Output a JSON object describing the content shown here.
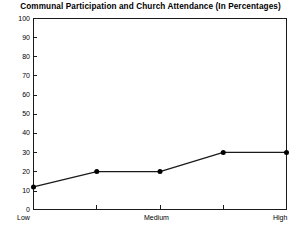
{
  "chart_data": {
    "type": "line",
    "title": "Communal Participation and Church Attendance (In Percentages)",
    "xlabel": "",
    "ylabel": "",
    "categories": [
      "Low",
      "",
      "Medium",
      "",
      "High"
    ],
    "values": [
      12,
      20,
      20,
      30,
      30
    ],
    "series": [
      {
        "name": "Church Attendance",
        "values": [
          12,
          20,
          20,
          30,
          30
        ]
      }
    ],
    "ylim": [
      0,
      100
    ],
    "ytick_labels": [
      "100",
      "90",
      "80",
      "70",
      "60",
      "50",
      "40",
      "30",
      "20",
      "10",
      "0"
    ],
    "ytick_values": [
      100,
      90,
      80,
      70,
      60,
      50,
      40,
      30,
      20,
      10,
      0
    ],
    "xtick_labels": [
      "Low",
      "Medium",
      "High"
    ],
    "grid": false,
    "legend": "none",
    "marker": "filled-circle",
    "line_color": "#1a1a1a",
    "marker_color": "#000000",
    "frame_color": "#1a1a1a",
    "background": "#ffffff"
  }
}
